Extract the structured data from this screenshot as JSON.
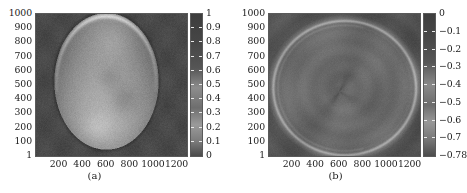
{
  "figure": {
    "background": "#ffffff",
    "panel_count": 2
  },
  "chart_data": [
    {
      "type": "heatmap",
      "panel": "a",
      "caption": "(a)",
      "title": "",
      "xlabel": "",
      "ylabel": "",
      "xlim": [
        1,
        1280
      ],
      "ylim": [
        1,
        1024
      ],
      "xticks": [
        200,
        400,
        600,
        800,
        1000,
        1200
      ],
      "xticklabels": [
        "200",
        "400",
        "600",
        "800",
        "1000",
        "1200"
      ],
      "yticks": [
        1,
        100,
        200,
        300,
        400,
        500,
        600,
        700,
        800,
        900,
        1000
      ],
      "yticklabels": [
        "1",
        "100",
        "200",
        "300",
        "400",
        "500",
        "600",
        "700",
        "800",
        "900",
        "1000"
      ],
      "grid": false,
      "legend": "none",
      "colormap": "gray",
      "colorbar": {
        "position": "right",
        "vmin": 0,
        "vmax": 1,
        "ticks": [
          0,
          0.1,
          0.2,
          0.3,
          0.4,
          0.5,
          0.6,
          0.7,
          0.8,
          0.9,
          1
        ],
        "ticklabels": [
          "0",
          "0.1",
          "0.2",
          "0.3",
          "0.4",
          "0.5",
          "0.6",
          "0.7",
          "0.8",
          "0.9",
          "1"
        ],
        "label_order_top_to_bottom": [
          "1",
          "0.9",
          "0.8",
          "0.7",
          "0.6",
          "0.5",
          "0.4",
          "0.3",
          "0.2",
          "0.1",
          "0"
        ]
      },
      "image_description": "Grayscale map of an oval/elliptical bright object on a dark background; object spans roughly x 150-1050, y 30-1010, with brighter rim near the upper boundary and mottled interior texture.",
      "background_value": 0.28,
      "object_mean_value": 0.62,
      "object_peak_value": 0.85
    },
    {
      "type": "heatmap",
      "panel": "b",
      "caption": "(b)",
      "title": "",
      "xlabel": "",
      "ylabel": "",
      "xlim": [
        1,
        1280
      ],
      "ylim": [
        1,
        1024
      ],
      "xticks": [
        200,
        400,
        600,
        800,
        1000,
        1200
      ],
      "xticklabels": [
        "200",
        "400",
        "600",
        "800",
        "1000",
        "1200"
      ],
      "yticks": [
        1,
        100,
        200,
        300,
        400,
        500,
        600,
        700,
        800,
        900,
        1000
      ],
      "yticklabels": [
        "1",
        "100",
        "200",
        "300",
        "400",
        "500",
        "600",
        "700",
        "800",
        "900",
        "1000"
      ],
      "grid": false,
      "legend": "none",
      "colormap": "gray",
      "colorbar": {
        "position": "right",
        "vmin": -0.78,
        "vmax": 0,
        "ticks": [
          -0.78,
          -0.7,
          -0.6,
          -0.5,
          -0.4,
          -0.3,
          -0.2,
          -0.1,
          0
        ],
        "ticklabels": [
          "−0.78",
          "−0.7",
          "−0.6",
          "−0.5",
          "−0.4",
          "−0.3",
          "−0.2",
          "−0.1",
          "0"
        ],
        "label_order_top_to_bottom": [
          "0",
          "−0.1",
          "−0.2",
          "−0.3",
          "−0.4",
          "−0.5",
          "−0.6",
          "−0.7",
          "−0.78"
        ]
      },
      "image_description": "Near-uniform dark grayscale residual map with a bright thin circular arc/ring near the image border and a faint dark radial streak converging toward the centre at about (600, 470).",
      "background_value": -0.4,
      "ring_value": -0.12,
      "centre_streak_value": -0.5
    }
  ],
  "panel_a": {
    "caption": "(a)",
    "yticklabels": [
      "1000",
      "900",
      "800",
      "700",
      "600",
      "500",
      "400",
      "300",
      "200",
      "100",
      "1"
    ],
    "xticklabels": [
      "200",
      "400",
      "600",
      "800",
      "1000",
      "1200"
    ],
    "cticklabels": [
      "1",
      "0.9",
      "0.8",
      "0.7",
      "0.6",
      "0.5",
      "0.4",
      "0.3",
      "0.2",
      "0.1",
      "0"
    ]
  },
  "panel_b": {
    "caption": "(b)",
    "yticklabels": [
      "1000",
      "900",
      "800",
      "700",
      "600",
      "500",
      "400",
      "300",
      "200",
      "100",
      "1"
    ],
    "xticklabels": [
      "200",
      "400",
      "600",
      "800",
      "1000",
      "1200"
    ],
    "cticklabels": [
      "0",
      "−0.1",
      "−0.2",
      "−0.3",
      "−0.4",
      "−0.5",
      "−0.6",
      "−0.7",
      "−0.78"
    ]
  }
}
